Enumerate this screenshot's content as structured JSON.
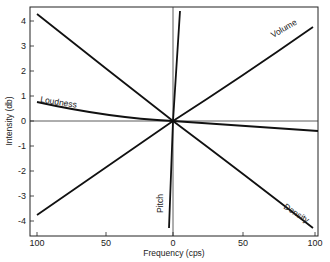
{
  "chart_data": {
    "type": "line",
    "title": "",
    "xlabel": "Frequency (cps)",
    "ylabel": "Intensity (db)",
    "x_tick_labels": [
      "100",
      "50",
      "0",
      "50",
      "100"
    ],
    "x_ticks": [
      -100,
      -50,
      0,
      50,
      100
    ],
    "y_tick_labels": [
      "4",
      "3",
      "2",
      "1",
      "0",
      "-1",
      "-2",
      "-3",
      "-4"
    ],
    "y_ticks": [
      4,
      3,
      2,
      1,
      0,
      -1,
      -2,
      -3,
      -4
    ],
    "xlim": [
      -100,
      100
    ],
    "ylim": [
      -4.5,
      4.5
    ],
    "grid": false,
    "reference_lines": {
      "x": 0,
      "y": 0
    },
    "series": [
      {
        "name": "Volume",
        "x": [
          -100,
          -50,
          0,
          50,
          100
        ],
        "y": [
          -3.75,
          -2.0,
          0,
          1.9,
          3.75
        ]
      },
      {
        "name": "Loudness",
        "x": [
          -100,
          -50,
          0,
          50,
          100
        ],
        "y": [
          0.75,
          0.35,
          0,
          -0.25,
          -0.45
        ]
      },
      {
        "name": "Pitch",
        "x": [
          -3,
          0,
          5
        ],
        "y": [
          -4.3,
          0,
          4.3
        ]
      },
      {
        "name": "Density",
        "x": [
          -100,
          -50,
          0,
          50,
          100
        ],
        "y": [
          4.25,
          2.1,
          0,
          -2.2,
          -4.25
        ]
      }
    ]
  },
  "labels": {
    "volume": "Volume",
    "loudness": "Loudness",
    "pitch": "Pitch",
    "density": "Density",
    "xlabel": "Frequency (cps)",
    "ylabel": "Intensity (db)"
  }
}
